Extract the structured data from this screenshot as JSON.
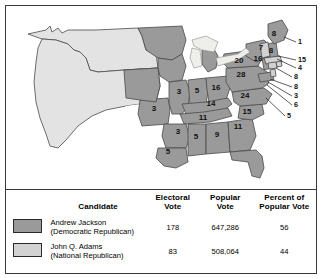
{
  "figure": {
    "colors": {
      "jackson_fill": "#9a9a9a",
      "adams_fill": "#d2d2d2",
      "unshaded_fill": "#e3e3e3",
      "border": "#3a3a3a",
      "state_line": "#4a4a4a",
      "background": "#ffffff"
    }
  },
  "map": {
    "name": "election-map",
    "state_labels": [
      {
        "id": "missouri",
        "value": "3",
        "x": 148,
        "y": 105
      },
      {
        "id": "illinois",
        "value": "3",
        "x": 173,
        "y": 88
      },
      {
        "id": "indiana",
        "value": "5",
        "x": 191,
        "y": 87
      },
      {
        "id": "ohio",
        "value": "16",
        "x": 210,
        "y": 84
      },
      {
        "id": "kentucky",
        "value": "14",
        "x": 205,
        "y": 100
      },
      {
        "id": "tennessee",
        "value": "11",
        "x": 197,
        "y": 114
      },
      {
        "id": "arkansas",
        "value": "3",
        "x": 172,
        "y": 128
      },
      {
        "id": "louisiana",
        "value": "5",
        "x": 162,
        "y": 148
      },
      {
        "id": "mississippi",
        "value": "5",
        "x": 190,
        "y": 133
      },
      {
        "id": "alabama",
        "value": "9",
        "x": 211,
        "y": 131
      },
      {
        "id": "georgia",
        "value": "11",
        "x": 232,
        "y": 123
      },
      {
        "id": "south-carolina",
        "value": "15",
        "x": 241,
        "y": 108
      },
      {
        "id": "north-carolina",
        "value": "24",
        "x": 239,
        "y": 92
      },
      {
        "id": "virginia",
        "value": "28",
        "x": 235,
        "y": 71
      },
      {
        "id": "pennsylvania",
        "value": "20",
        "x": 233,
        "y": 57
      },
      {
        "id": "new-york",
        "value": "16",
        "x": 252,
        "y": 55
      },
      {
        "id": "vermont",
        "value": "7",
        "x": 255,
        "y": 44
      },
      {
        "id": "new-hampshire",
        "value": "8",
        "x": 265,
        "y": 47
      },
      {
        "id": "maine",
        "value": "8",
        "x": 268,
        "y": 30
      }
    ],
    "leader_labels": [
      {
        "id": "massachusetts",
        "value": "1",
        "x": 292,
        "y": 38,
        "lx1": 290,
        "ly1": 36,
        "lx2": 278,
        "ly2": 31
      },
      {
        "id": "rhode-island",
        "value": "15",
        "x": 292,
        "y": 56,
        "lx1": 290,
        "ly1": 54,
        "lx2": 272,
        "ly2": 50
      },
      {
        "id": "connecticut",
        "value": "4",
        "x": 292,
        "y": 64,
        "lx1": 290,
        "ly1": 62,
        "lx2": 271,
        "ly2": 53
      },
      {
        "id": "new-jersey",
        "value": "8",
        "x": 288,
        "y": 73,
        "lx1": 286,
        "ly1": 71,
        "lx2": 270,
        "ly2": 62
      },
      {
        "id": "delaware",
        "value": "8",
        "x": 288,
        "y": 83,
        "lx1": 286,
        "ly1": 81,
        "lx2": 264,
        "ly2": 73
      },
      {
        "id": "maryland",
        "value": "3",
        "x": 288,
        "y": 92,
        "lx1": 286,
        "ly1": 90,
        "lx2": 262,
        "ly2": 76
      },
      {
        "id": "maryland-b",
        "value": "6",
        "x": 288,
        "y": 101,
        "lx1": 286,
        "ly1": 99,
        "lx2": 261,
        "ly2": 79
      },
      {
        "id": "south-carolina-b",
        "value": "5",
        "x": 281,
        "y": 112,
        "lx1": 279,
        "ly1": 110,
        "lx2": 260,
        "ly2": 92
      }
    ]
  },
  "table": {
    "name": "election-results-table",
    "headers": {
      "swatch": "",
      "candidate": "Candidate",
      "electoral_vote": "Electoral\nVote",
      "electoral_vote_l1": "Electoral",
      "electoral_vote_l2": "Vote",
      "popular_vote_l1": "Popular",
      "popular_vote_l2": "Vote",
      "percent_l1": "Percent of",
      "percent_l2": "Popular Vote"
    },
    "rows": [
      {
        "id": "jackson",
        "name": "Andrew Jackson",
        "party": "(Democratic Republican)",
        "electoral_vote": "178",
        "popular_vote": "647,286",
        "percent": "56",
        "color": "#9a9a9a"
      },
      {
        "id": "adams",
        "name": "John Q. Adams",
        "party": "(National Republican)",
        "electoral_vote": "83",
        "popular_vote": "508,064",
        "percent": "44",
        "color": "#d2d2d2"
      }
    ]
  }
}
